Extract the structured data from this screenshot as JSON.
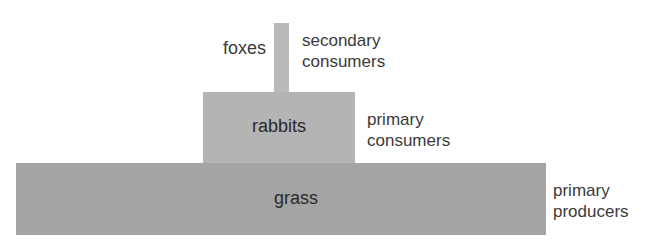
{
  "diagram": {
    "type": "pyramid of numbers",
    "levels": [
      {
        "organism": "foxes",
        "trophic_level": "secondary consumers"
      },
      {
        "organism": "rabbits",
        "trophic_level": "primary consumers"
      },
      {
        "organism": "grass",
        "trophic_level": "primary producers"
      }
    ]
  },
  "labels": {
    "foxes": "foxes",
    "rabbits": "rabbits",
    "grass": "grass",
    "secondary_1": "secondary",
    "secondary_2": "consumers",
    "primary_cons_1": "primary",
    "primary_cons_2": "consumers",
    "producers_1": "primary",
    "producers_2": "producers"
  },
  "colors": {
    "grass_bar": "#a4a4a4",
    "rabbits_bar": "#b4b4b4",
    "foxes_bar": "#bababa"
  }
}
